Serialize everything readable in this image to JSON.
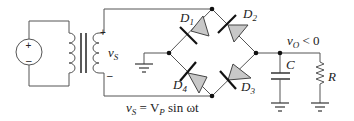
{
  "diagram": {
    "source": {
      "plus": "+",
      "minus": "–"
    },
    "transformer": {
      "secondary_label": "v",
      "secondary_sub": "S",
      "plus": "+",
      "minus": "–"
    },
    "diodes": [
      {
        "name": "D",
        "sub": "1"
      },
      {
        "name": "D",
        "sub": "2"
      },
      {
        "name": "D",
        "sub": "3"
      },
      {
        "name": "D",
        "sub": "4"
      }
    ],
    "output": {
      "label": "v",
      "sub": "O",
      "rest": " < 0"
    },
    "capacitor": {
      "label": "C"
    },
    "resistor": {
      "label": "R"
    },
    "equation": {
      "lhs": "v",
      "lhs_sub": "S",
      "eq": " = V",
      "vp_sub": "P",
      "rest": " sin ωt"
    }
  }
}
